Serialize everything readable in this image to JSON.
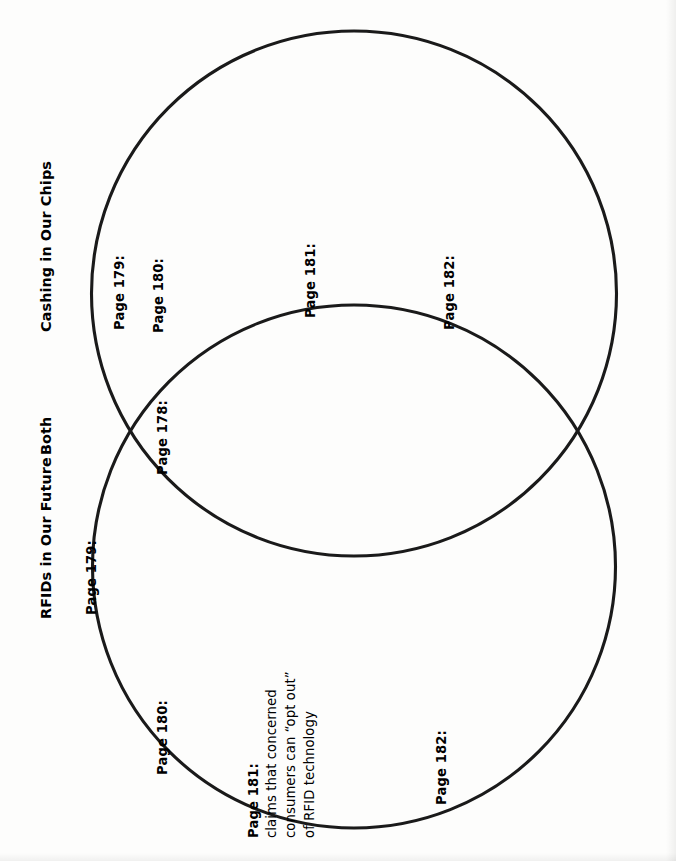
{
  "worksheet": {
    "type": "venn-diagram",
    "orientation": "rotated-90-counterclockwise",
    "stroke_color": "#1a1a1a",
    "background_color": "#fdfdfc"
  },
  "headings": {
    "left_set": "Cashing in Our Chips",
    "overlap": "Both",
    "right_set": "RFIDs in Our Future"
  },
  "sets": {
    "cashing_in_our_chips": {
      "title": "Cashing in Our Chips",
      "entries": [
        {
          "label": "Page 179:",
          "body": ""
        },
        {
          "label": "Page 180:",
          "body": ""
        },
        {
          "label": "Page 181:",
          "body": ""
        },
        {
          "label": "Page 182:",
          "body": ""
        }
      ]
    },
    "both": {
      "title": "Both",
      "entries": [
        {
          "label": "Page 178:",
          "body": ""
        }
      ]
    },
    "rfids_in_our_future": {
      "title": "RFIDs in Our Future",
      "entries": [
        {
          "label": "Page 179:",
          "body": ""
        },
        {
          "label": "Page 180:",
          "body": ""
        },
        {
          "label": "Page 181:",
          "lines": [
            "claims that concerned",
            "consumers can “opt out”",
            "of RFID technology"
          ]
        },
        {
          "label": "Page 182:",
          "body": ""
        }
      ]
    }
  },
  "labels": {
    "top_179": "Page 179:",
    "top_180": "Page 180:",
    "top_181": "Page 181:",
    "top_182": "Page 182:",
    "overlap_178": "Page 178:",
    "bottom_179": "Page 179:",
    "bottom_180": "Page 180:",
    "bottom_181_label": "Page 181:",
    "bottom_181_line1": "claims that concerned",
    "bottom_181_line2": "consumers can “opt out”",
    "bottom_181_line3": "of RFID technology",
    "bottom_182": "Page 182:"
  }
}
